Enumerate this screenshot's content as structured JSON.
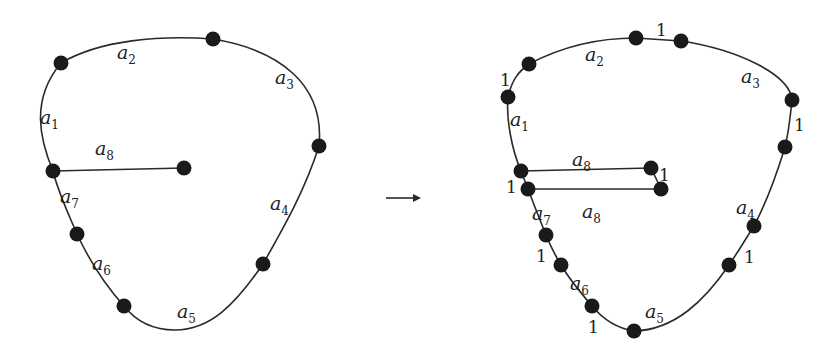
{
  "figure": {
    "left": {
      "arc_labels": [
        {
          "id": "a1",
          "base": "a",
          "sub": "1",
          "x": 40,
          "y": 124
        },
        {
          "id": "a2",
          "base": "a",
          "sub": "2",
          "x": 117,
          "y": 59
        },
        {
          "id": "a3",
          "base": "a",
          "sub": "3",
          "x": 275,
          "y": 84
        },
        {
          "id": "a4",
          "base": "a",
          "sub": "4",
          "x": 270,
          "y": 210
        },
        {
          "id": "a5",
          "base": "a",
          "sub": "5",
          "x": 177,
          "y": 318
        },
        {
          "id": "a6",
          "base": "a",
          "sub": "6",
          "x": 92,
          "y": 270
        },
        {
          "id": "a7",
          "base": "a",
          "sub": "7",
          "x": 60,
          "y": 203
        },
        {
          "id": "a8",
          "base": "a",
          "sub": "8",
          "x": 95,
          "y": 155
        }
      ],
      "vertices": [
        [
          61,
          63
        ],
        [
          213,
          39
        ],
        [
          319,
          146
        ],
        [
          53,
          171
        ],
        [
          184,
          168
        ],
        [
          77,
          234
        ],
        [
          124,
          306
        ],
        [
          263,
          264
        ]
      ]
    },
    "arrow": {
      "symbol": "→",
      "x1": 386,
      "x2": 421,
      "y": 198
    },
    "right": {
      "arc_labels": [
        {
          "id": "a1",
          "base": "a",
          "sub": "1",
          "x": 510,
          "y": 126
        },
        {
          "id": "a2",
          "base": "a",
          "sub": "2",
          "x": 585,
          "y": 61
        },
        {
          "id": "a3",
          "base": "a",
          "sub": "3",
          "x": 741,
          "y": 83
        },
        {
          "id": "a4",
          "base": "a",
          "sub": "4",
          "x": 736,
          "y": 214
        },
        {
          "id": "a5",
          "base": "a",
          "sub": "5",
          "x": 645,
          "y": 318
        },
        {
          "id": "a6",
          "base": "a",
          "sub": "6",
          "x": 570,
          "y": 290
        },
        {
          "id": "a7",
          "base": "a",
          "sub": "7",
          "x": 532,
          "y": 220
        },
        {
          "id": "a8_top",
          "base": "a",
          "sub": "8",
          "x": 572,
          "y": 166
        },
        {
          "id": "a8_bottom",
          "base": "a",
          "sub": "8",
          "x": 582,
          "y": 218
        }
      ],
      "unit_labels": [
        {
          "text": "1",
          "x": 656,
          "y": 36
        },
        {
          "text": "1",
          "x": 500,
          "y": 86
        },
        {
          "text": "1",
          "x": 794,
          "y": 131
        },
        {
          "text": "1",
          "x": 659,
          "y": 181
        },
        {
          "text": "1",
          "x": 506,
          "y": 193
        },
        {
          "text": "1",
          "x": 536,
          "y": 262
        },
        {
          "text": "1",
          "x": 588,
          "y": 333
        },
        {
          "text": "1",
          "x": 744,
          "y": 263
        }
      ],
      "vertices": [
        [
          636,
          38
        ],
        [
          681,
          41
        ],
        [
          529,
          64
        ],
        [
          508,
          97
        ],
        [
          792,
          100
        ],
        [
          785,
          147
        ],
        [
          521,
          171
        ],
        [
          651,
          168
        ],
        [
          528,
          189
        ],
        [
          661,
          189
        ],
        [
          546,
          235
        ],
        [
          561,
          265
        ],
        [
          592,
          306
        ],
        [
          634,
          331
        ],
        [
          754,
          226
        ],
        [
          729,
          265
        ]
      ]
    }
  }
}
